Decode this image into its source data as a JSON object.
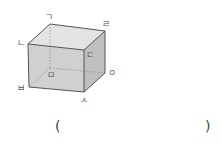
{
  "diagram": {
    "type": "cuboid",
    "vertices": {
      "top_back_left": {
        "label": "ㄱ",
        "x": 50,
        "y": 24
      },
      "top_front_left": {
        "label": "ㄴ",
        "x": 28,
        "y": 44
      },
      "top_front_right": {
        "label": "ㄷ",
        "x": 84,
        "y": 50
      },
      "top_back_right": {
        "label": "ㄹ",
        "x": 105,
        "y": 31
      },
      "bottom_back_left": {
        "label": "ㅁ",
        "x": 50,
        "y": 68
      },
      "bottom_front_left": {
        "label": "ㅂ",
        "x": 29,
        "y": 87
      },
      "bottom_front_right": {
        "label": "ㅅ",
        "x": 84,
        "y": 92
      },
      "bottom_back_right": {
        "label": "ㅇ",
        "x": 105,
        "y": 73
      }
    },
    "colors": {
      "top_face": "#e4e4e4",
      "front_face": "#d0d0d0",
      "side_face": "#bfbfbf",
      "edge": "#555555",
      "hidden_edge": "#8a8a8a"
    }
  },
  "answer": {
    "open_paren": "(",
    "close_paren": ")",
    "value": ""
  }
}
